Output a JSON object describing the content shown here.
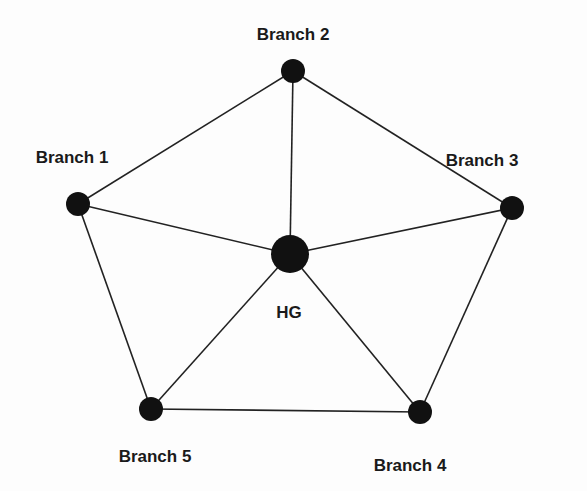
{
  "diagram": {
    "type": "network-topology",
    "colors": {
      "node": "#111111",
      "edge": "#222222",
      "text": "#1a1a1a",
      "background": "#fdfdfd"
    },
    "nodes": [
      {
        "id": "hg",
        "label": "HG",
        "x": 290,
        "y": 254,
        "r": 19,
        "lx": 289,
        "ly": 318
      },
      {
        "id": "b1",
        "label": "Branch 1",
        "x": 78,
        "y": 204,
        "r": 12,
        "lx": 72,
        "ly": 163
      },
      {
        "id": "b2",
        "label": "Branch 2",
        "x": 293,
        "y": 71,
        "r": 12,
        "lx": 293,
        "ly": 40
      },
      {
        "id": "b3",
        "label": "Branch 3",
        "x": 512,
        "y": 208,
        "r": 12,
        "lx": 482,
        "ly": 166
      },
      {
        "id": "b4",
        "label": "Branch 4",
        "x": 420,
        "y": 412,
        "r": 12,
        "lx": 410,
        "ly": 471
      },
      {
        "id": "b5",
        "label": "Branch 5",
        "x": 151,
        "y": 409,
        "r": 12,
        "lx": 155,
        "ly": 462
      }
    ],
    "edges": [
      [
        "b1",
        "b2"
      ],
      [
        "b2",
        "b3"
      ],
      [
        "b3",
        "b4"
      ],
      [
        "b4",
        "b5"
      ],
      [
        "b5",
        "b1"
      ],
      [
        "hg",
        "b1"
      ],
      [
        "hg",
        "b2"
      ],
      [
        "hg",
        "b3"
      ],
      [
        "hg",
        "b4"
      ],
      [
        "hg",
        "b5"
      ]
    ]
  }
}
